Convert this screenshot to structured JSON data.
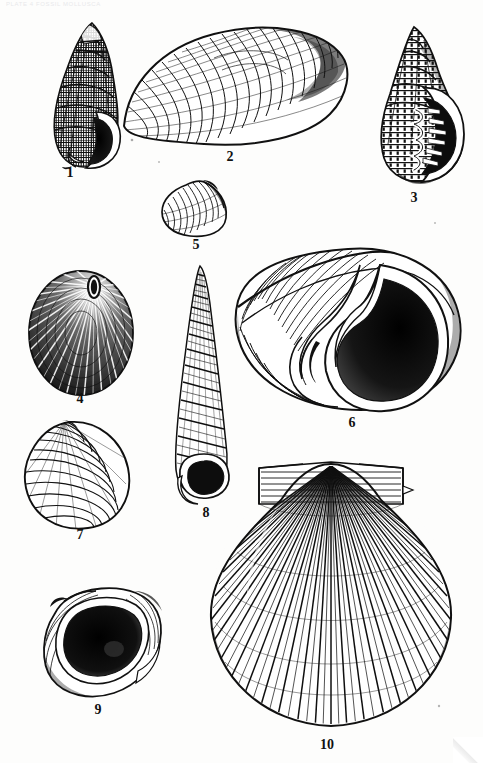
{
  "plate": {
    "header_text": "PLATE 4    FOSSIL MOLLUSCA",
    "background_color": "#fdfdfc",
    "ink_color": "#111111",
    "width": 483,
    "height": 763
  },
  "figures": [
    {
      "number": "1",
      "name": "nassarius-gastropod",
      "kind": "gastropod-high-spired",
      "description": "High-spired cancellate gastropod with reticulate sculpture and broad aperture",
      "x": 40,
      "y": 20,
      "w": 105,
      "h": 150,
      "label_x": 70,
      "label_y": 172
    },
    {
      "number": "2",
      "name": "venerid-bivalve-left-valve",
      "kind": "bivalve-ovate",
      "description": "Large ovate bivalve valve with fine concentric ribbing",
      "x": 120,
      "y": 20,
      "w": 230,
      "h": 130,
      "label_x": 230,
      "label_y": 152
    },
    {
      "number": "3",
      "name": "buccinid-gastropod",
      "kind": "gastropod-beaded",
      "description": "Beaded-spired gastropod with strongly dentate inner lip and dark aperture",
      "x": 365,
      "y": 25,
      "w": 115,
      "h": 165,
      "label_x": 400,
      "label_y": 193
    },
    {
      "number": "4",
      "name": "keyhole-limpet",
      "kind": "limpet-fissurellid",
      "description": "Keyhole limpet seen from above with elongate central apical orifice and radial ribs",
      "x": 22,
      "y": 270,
      "w": 115,
      "h": 125,
      "label_x": 70,
      "label_y": 396
    },
    {
      "number": "5",
      "name": "small-bivalve-valve",
      "kind": "bivalve-small",
      "description": "Small trigonal bivalve valve with prominent beak",
      "x": 160,
      "y": 180,
      "w": 70,
      "h": 58,
      "label_x": 186,
      "label_y": 240
    },
    {
      "number": "6",
      "name": "naticid-moon-snail",
      "kind": "gastropod-globose",
      "description": "Large globose moon-snail with wide aperture, thick callus and deep umbilicus",
      "x": 230,
      "y": 245,
      "w": 235,
      "h": 170,
      "label_x": 342,
      "label_y": 418
    },
    {
      "number": "7",
      "name": "venerid-bivalve-valve",
      "kind": "bivalve-rounded",
      "description": "Rounded bivalve valve with concentric growth lamellae",
      "x": 20,
      "y": 420,
      "w": 115,
      "h": 110,
      "label_x": 70,
      "label_y": 532
    },
    {
      "number": "8",
      "name": "turritella-turret-shell",
      "kind": "gastropod-turriculate",
      "description": "Slender many-whorled turret shell with spiral cords",
      "x": 165,
      "y": 265,
      "w": 70,
      "h": 240,
      "label_x": 196,
      "label_y": 508
    },
    {
      "number": "9",
      "name": "oyster-valve-interior",
      "kind": "bivalve-oyster",
      "description": "Irregular oyster valve showing dark muscle scar and thickened margin",
      "x": 40,
      "y": 585,
      "w": 125,
      "h": 115,
      "label_x": 96,
      "label_y": 705
    },
    {
      "number": "10",
      "name": "pecten-scallop-valve",
      "kind": "bivalve-pectinid",
      "description": "Large scallop valve with numerous radial ribs and prominent auricles",
      "x": 205,
      "y": 458,
      "w": 250,
      "h": 280,
      "label_x": 327,
      "label_y": 740
    }
  ]
}
